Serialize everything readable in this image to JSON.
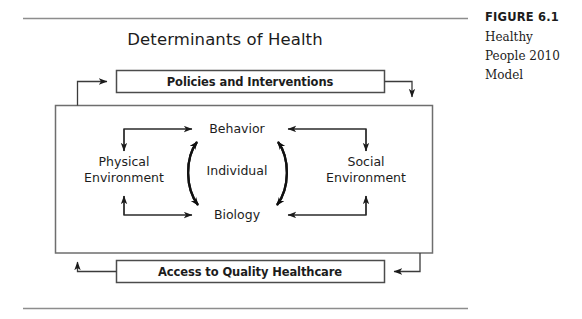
{
  "figure": {
    "number_label": "FIGURE 6.1",
    "caption_line1": "Healthy",
    "caption_line2": "People 2010",
    "caption_line3": "Model"
  },
  "diagram": {
    "title": "Determinants of Health",
    "top_box_label": "Policies and Interventions",
    "bottom_box_label": "Access to Quality Healthcare",
    "left_node_line1": "Physical",
    "left_node_line2": "Environment",
    "right_node_line1": "Social",
    "right_node_line2": "Environment",
    "center_top_node": "Behavior",
    "center_middle_node": "Individual",
    "center_bottom_node": "Biology"
  },
  "colors": {
    "text": "#1c1c1c",
    "rule": "#8d8d8d",
    "box_stroke": "#4c4c4c",
    "outer_stroke": "#6e6e6e",
    "connector": "#3b3b3b",
    "background": "#ffffff"
  }
}
